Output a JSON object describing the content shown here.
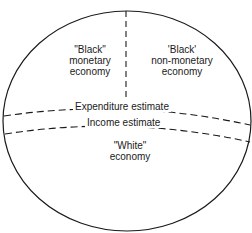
{
  "diagram": {
    "regions": [
      {
        "id": "black-monetary",
        "lines": [
          "\"Black\"",
          "monetary",
          "economy"
        ]
      },
      {
        "id": "black-non-monetary",
        "lines": [
          "'Black'",
          "non-monetary",
          "economy"
        ]
      },
      {
        "id": "white",
        "lines": [
          "\"White\"",
          "economy"
        ]
      }
    ],
    "boundaries": {
      "expenditure": "Expenditure estimate",
      "income": "Income estimate"
    },
    "colors": {
      "line": "#1a1a1a",
      "background": "#ffffff"
    }
  }
}
